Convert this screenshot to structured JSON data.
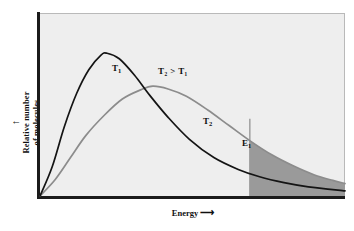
{
  "chart_data": {
    "type": "line",
    "title": "",
    "xlabel": "Energy",
    "ylabel": "Relative number\nof molecules",
    "xlabel_arrow": "⟶",
    "ylabel_arrow": "↑",
    "grid": false,
    "legend": "inline-labels",
    "annotations": [
      {
        "name": "t1-curve-label",
        "text": "T",
        "sub": "1"
      },
      {
        "name": "t2-curve-label",
        "text": "T",
        "sub": "2"
      },
      {
        "name": "temperature-inequality",
        "text": "T₂ > T₁"
      },
      {
        "name": "activation-energy-label",
        "text": "E",
        "sub": "1"
      }
    ],
    "series": [
      {
        "name": "T1",
        "label": "T",
        "label_sub": "1",
        "color": "#141414",
        "description": "Maxwell-Boltzmann distribution at lower temperature; taller, narrower peak occurring at lower energy",
        "peak_x_frac": 0.22,
        "peak_y_frac": 0.78,
        "points_frac": [
          [
            0.0,
            0.0
          ],
          [
            0.04,
            0.16
          ],
          [
            0.08,
            0.38
          ],
          [
            0.12,
            0.56
          ],
          [
            0.16,
            0.69
          ],
          [
            0.2,
            0.77
          ],
          [
            0.22,
            0.78
          ],
          [
            0.26,
            0.75
          ],
          [
            0.31,
            0.66
          ],
          [
            0.36,
            0.55
          ],
          [
            0.42,
            0.43
          ],
          [
            0.49,
            0.31
          ],
          [
            0.57,
            0.21
          ],
          [
            0.65,
            0.145
          ],
          [
            0.72,
            0.105
          ],
          [
            0.8,
            0.073
          ],
          [
            0.88,
            0.05
          ],
          [
            1.0,
            0.028
          ]
        ]
      },
      {
        "name": "T2",
        "label": "T",
        "label_sub": "2",
        "color": "#8c8c8c",
        "description": "Maxwell-Boltzmann distribution at higher temperature; broader, lower peak shifted to higher energy",
        "peak_x_frac": 0.37,
        "peak_y_frac": 0.6,
        "points_frac": [
          [
            0.0,
            0.0
          ],
          [
            0.05,
            0.09
          ],
          [
            0.1,
            0.21
          ],
          [
            0.15,
            0.33
          ],
          [
            0.21,
            0.44
          ],
          [
            0.27,
            0.53
          ],
          [
            0.33,
            0.58
          ],
          [
            0.37,
            0.6
          ],
          [
            0.42,
            0.585
          ],
          [
            0.48,
            0.545
          ],
          [
            0.55,
            0.47
          ],
          [
            0.62,
            0.385
          ],
          [
            0.69,
            0.3
          ],
          [
            0.76,
            0.225
          ],
          [
            0.83,
            0.165
          ],
          [
            0.9,
            0.115
          ],
          [
            0.96,
            0.085
          ],
          [
            1.0,
            0.068
          ]
        ]
      }
    ],
    "threshold": {
      "name": "E1",
      "label": "E",
      "label_sub": "1",
      "x_frac": 0.688,
      "line_color": "#9a9a9a",
      "shade_color": "#9a9a9a",
      "shade_description": "Shaded region under the T2 curve to the right of E1, representing molecules with energy above the activation energy"
    },
    "axes": {
      "plot_background": "#eeeeee",
      "spine_color": "#1b1b1b",
      "frame_color": "#b9b9b9",
      "x_ticks": [],
      "y_ticks": []
    }
  }
}
